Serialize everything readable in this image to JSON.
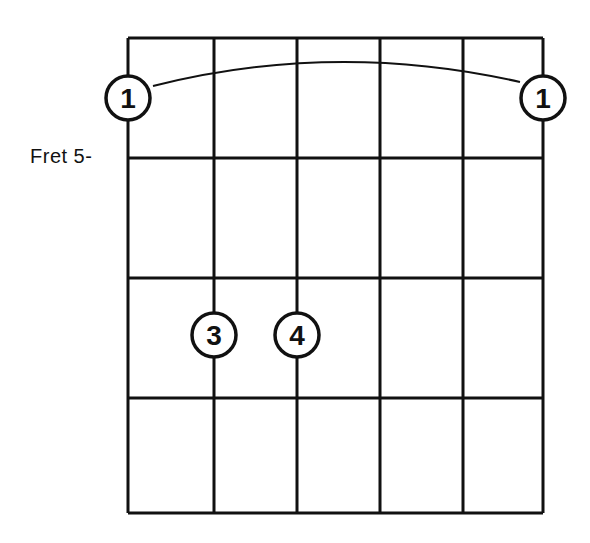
{
  "diagram": {
    "type": "guitar-chord-diagram",
    "fret_label": "Fret 5-",
    "strings": 6,
    "fret_rows": 4,
    "colors": {
      "line": "#111111",
      "background": "#ffffff"
    },
    "grid": {
      "x": [
        128,
        214,
        297,
        380,
        463,
        543
      ],
      "y": [
        38,
        158,
        278,
        398,
        513
      ]
    },
    "barre": {
      "from_string": 1,
      "to_string": 6,
      "finger": "1"
    },
    "fingers": [
      {
        "label": "1",
        "string": 1,
        "cx": 128,
        "cy": 98
      },
      {
        "label": "1",
        "string": 6,
        "cx": 543,
        "cy": 98
      },
      {
        "label": "3",
        "string": 2,
        "cx": 214,
        "cy": 335
      },
      {
        "label": "4",
        "string": 3,
        "cx": 297,
        "cy": 335
      }
    ]
  }
}
